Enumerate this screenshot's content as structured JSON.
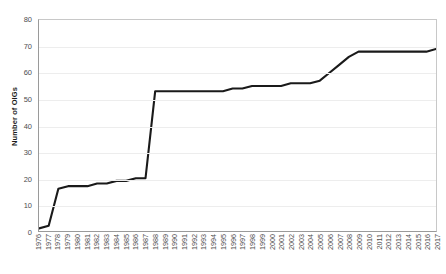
{
  "chart_data": {
    "type": "line",
    "title": "",
    "xlabel": "",
    "ylabel": "Number of OIGs",
    "ylim": [
      0,
      80
    ],
    "yticks": [
      0,
      10,
      20,
      30,
      40,
      50,
      60,
      70,
      80
    ],
    "grid": true,
    "legend": "none",
    "line_color": "#1a1a1a",
    "categories": [
      "1976",
      "1977",
      "1978",
      "1979",
      "1980",
      "1981",
      "1982",
      "1983",
      "1984",
      "1985",
      "1986",
      "1987",
      "1988",
      "1989",
      "1990",
      "1991",
      "1992",
      "1993",
      "1994",
      "1995",
      "1996",
      "1997",
      "1998",
      "1999",
      "2000",
      "2001",
      "2002",
      "2003",
      "2004",
      "2005",
      "2006",
      "2007",
      "2008",
      "2009",
      "2010",
      "2011",
      "2012",
      "2013",
      "2014",
      "2015",
      "2016",
      "2017"
    ],
    "values": [
      1,
      2,
      16,
      17,
      17,
      17,
      18,
      18,
      19,
      19,
      20,
      20,
      53,
      53,
      53,
      53,
      53,
      53,
      53,
      53,
      54,
      54,
      55,
      55,
      55,
      55,
      56,
      56,
      56,
      57,
      60,
      63,
      66,
      68,
      68,
      68,
      68,
      68,
      68,
      68,
      68,
      69
    ]
  },
  "axes": {
    "y_title": "Number of OIGs"
  }
}
